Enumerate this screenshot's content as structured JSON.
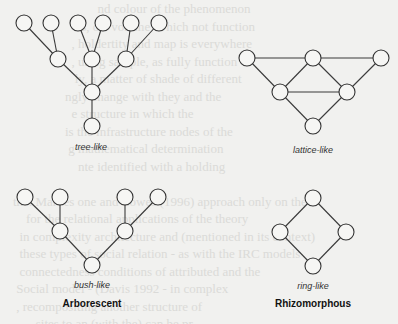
{
  "figure": {
    "panels": [
      {
        "id": "tree",
        "label": "tree-like",
        "nodes": [
          [
            24,
            23
          ],
          [
            51,
            23
          ],
          [
            78,
            23
          ],
          [
            103,
            23
          ],
          [
            131,
            23
          ],
          [
            159,
            23
          ],
          [
            58,
            59
          ],
          [
            92,
            59
          ],
          [
            126,
            59
          ],
          [
            92,
            92
          ],
          [
            92,
            126
          ]
        ],
        "edges": [
          [
            0,
            6
          ],
          [
            1,
            6
          ],
          [
            2,
            7
          ],
          [
            3,
            7
          ],
          [
            4,
            8
          ],
          [
            5,
            8
          ],
          [
            6,
            9
          ],
          [
            7,
            9
          ],
          [
            8,
            9
          ],
          [
            9,
            10
          ]
        ],
        "label_pos": [
          91,
          150
        ]
      },
      {
        "id": "lattice",
        "label": "lattice-like",
        "nodes": [
          [
            247,
            58
          ],
          [
            313,
            58
          ],
          [
            381,
            58
          ],
          [
            280,
            92
          ],
          [
            347,
            92
          ],
          [
            313,
            126
          ]
        ],
        "edges": [
          [
            0,
            1
          ],
          [
            1,
            2
          ],
          [
            0,
            3
          ],
          [
            1,
            3
          ],
          [
            1,
            4
          ],
          [
            2,
            4
          ],
          [
            3,
            4
          ],
          [
            3,
            5
          ],
          [
            4,
            5
          ]
        ],
        "label_pos": [
          313,
          153
        ]
      },
      {
        "id": "bush",
        "label": "bush-like",
        "nodes": [
          [
            25,
            197
          ],
          [
            60,
            197
          ],
          [
            125,
            197
          ],
          [
            158,
            197
          ],
          [
            60,
            231
          ],
          [
            125,
            231
          ],
          [
            92,
            265
          ]
        ],
        "edges": [
          [
            0,
            4
          ],
          [
            1,
            4
          ],
          [
            2,
            5
          ],
          [
            3,
            5
          ],
          [
            4,
            6
          ],
          [
            5,
            6
          ]
        ],
        "label_pos": [
          92,
          288
        ]
      },
      {
        "id": "ring",
        "label": "ring-like",
        "nodes": [
          [
            313,
            198
          ],
          [
            280,
            232
          ],
          [
            346,
            232
          ],
          [
            313,
            266
          ]
        ],
        "edges": [
          [
            0,
            1
          ],
          [
            0,
            2
          ],
          [
            1,
            3
          ],
          [
            2,
            3
          ]
        ],
        "label_pos": [
          313,
          289
        ]
      }
    ],
    "categories": [
      {
        "label": "Arborescent",
        "pos": [
          92,
          307
        ]
      },
      {
        "label": "Rhizomorphous",
        "pos": [
          313,
          307
        ]
      }
    ],
    "node_radius": 8
  },
  "labels": {
    "tree": "tree-like",
    "lattice": "lattice-like",
    "bush": "bush-like",
    "ring": "ring-like",
    "arborescent": "Arborescent",
    "rhizomorphous": "Rhizomorphous"
  }
}
